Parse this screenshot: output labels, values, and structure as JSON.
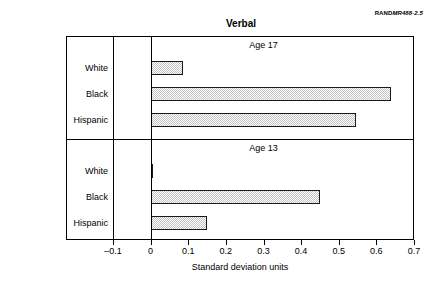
{
  "chart_data": {
    "type": "bar",
    "orientation": "horizontal",
    "title": "Verbal",
    "xlabel": "Standard deviation units",
    "ylabel": "",
    "xlim": [
      -0.1,
      0.7
    ],
    "xticks": [
      "–0.1",
      "0",
      "0.1",
      "0.2",
      "0.3",
      "0.4",
      "0.5",
      "0.6",
      "0.7"
    ],
    "xtick_values": [
      -0.1,
      0,
      0.1,
      0.2,
      0.3,
      0.4,
      0.5,
      0.6,
      0.7
    ],
    "grid": false,
    "legend": "none",
    "categories": [
      "White",
      "Black",
      "Hispanic"
    ],
    "panels": [
      {
        "label": "Age 17",
        "categories": [
          "White",
          "Black",
          "Hispanic"
        ],
        "values": [
          0.085,
          0.64,
          0.545
        ]
      },
      {
        "label": "Age 13",
        "categories": [
          "White",
          "Black",
          "Hispanic"
        ],
        "values": [
          0.005,
          0.45,
          0.15
        ]
      }
    ],
    "bar_fill_color": "#c3c3c3",
    "bar_edge_color": "#1a1a1a",
    "axis_color": "#000000"
  },
  "credit": {
    "prefix": "RAND",
    "report": "MR488-2.5"
  }
}
